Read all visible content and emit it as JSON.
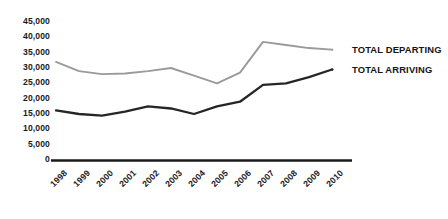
{
  "chart_data": {
    "type": "line",
    "title": "",
    "xlabel": "",
    "ylabel": "",
    "categories": [
      "1998",
      "1999",
      "2000",
      "2001",
      "2002",
      "2003",
      "2004",
      "2005",
      "2006",
      "2007",
      "2008",
      "2009",
      "2010"
    ],
    "ylim": [
      0,
      45000
    ],
    "yticks": [
      "0",
      "5,000",
      "10,000",
      "15,000",
      "20,000",
      "25,000",
      "30,000",
      "35,000",
      "40,000",
      "45,000"
    ],
    "ytick_values": [
      0,
      5000,
      10000,
      15000,
      20000,
      25000,
      30000,
      35000,
      40000,
      45000
    ],
    "grid": false,
    "legend_position": "right",
    "series": [
      {
        "name": "TOTAL DEPARTING",
        "color": "#9a9a9a",
        "values": [
          32000,
          29000,
          28000,
          28200,
          29000,
          30000,
          27500,
          25000,
          28500,
          38500,
          37500,
          36500,
          36000
        ]
      },
      {
        "name": "TOTAL ARRIVING",
        "color": "#262626",
        "values": [
          16200,
          15000,
          14500,
          15800,
          17500,
          16800,
          15000,
          17500,
          19000,
          24500,
          25000,
          27000,
          29500
        ]
      }
    ]
  },
  "legend": {
    "departing_label": "TOTAL DEPARTING",
    "arriving_label": "TOTAL ARRIVING"
  },
  "axis": {
    "baseline_color": "#1a1a1a"
  }
}
